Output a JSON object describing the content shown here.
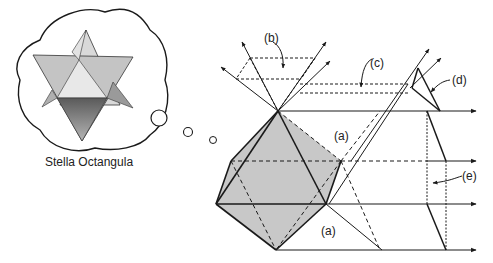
{
  "thought_bubble": {
    "caption": "Stella Octangula"
  },
  "labels": {
    "a_top": "(a)",
    "a_bottom": "(a)",
    "b": "(b)",
    "c": "(c)",
    "d": "(d)",
    "e": "(e)"
  },
  "colors": {
    "line": "#1a1a1a",
    "fill": "#c8c8c8",
    "star_light": "#cfcfcf",
    "star_dark": "#8a8a8a"
  }
}
